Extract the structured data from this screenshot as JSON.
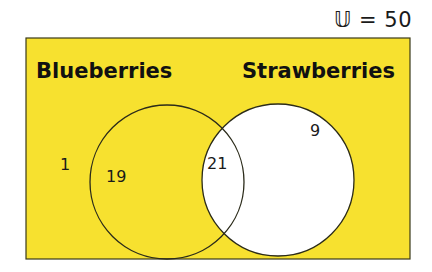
{
  "universe": {
    "symbol": "𝕌",
    "label": "𝕌 = 50",
    "total": 50
  },
  "sets": [
    {
      "name": "Blueberries",
      "label": "Blueberries"
    },
    {
      "name": "Strawberries",
      "label": "Strawberries"
    }
  ],
  "regions": {
    "neither": "1",
    "blueberries_only": "19",
    "both": "21",
    "strawberries_only": "9"
  },
  "colors": {
    "background": "#f7e12f",
    "border": "#3a3a1a",
    "shaded": "#f7e12f",
    "unshaded": "#ffffff"
  }
}
